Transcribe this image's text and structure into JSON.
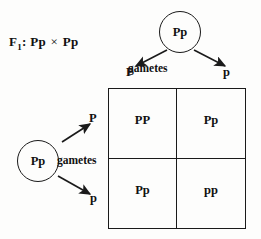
{
  "diagram": {
    "cross_label": {
      "prefix": "F",
      "subscript": "1",
      "separator": ":",
      "parent_a": "Pp",
      "operator": "×",
      "parent_b": "Pp"
    },
    "parents": {
      "top": {
        "genotype": "Pp",
        "gametes_label": "gametes"
      },
      "left": {
        "genotype": "Pp",
        "gametes_label": "gametes"
      }
    },
    "gametes": {
      "top_left": "P",
      "top_right": "p",
      "left_upper": "P",
      "left_lower": "p"
    },
    "punnett_square": {
      "cells": [
        {
          "position": "top-left",
          "genotype": "PP"
        },
        {
          "position": "top-right",
          "genotype": "Pp"
        },
        {
          "position": "bottom-left",
          "genotype": "Pp"
        },
        {
          "position": "bottom-right",
          "genotype": "pp"
        }
      ]
    },
    "colors": {
      "ink": "#1a1a1a",
      "background": "#fdfdfc"
    }
  }
}
